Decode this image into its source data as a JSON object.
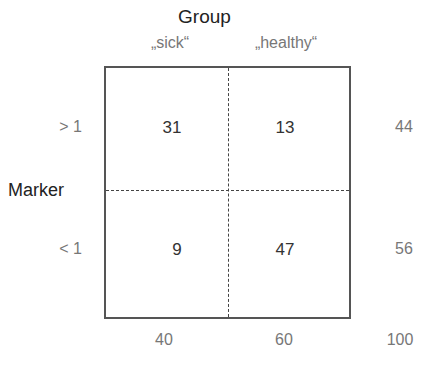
{
  "title": "Group",
  "columns": [
    "„sick“",
    "„healthy“"
  ],
  "row_axis_label": "Marker",
  "rows": [
    "> 1",
    "< 1"
  ],
  "cells": [
    [
      31,
      13
    ],
    [
      9,
      47
    ]
  ],
  "row_totals": [
    44,
    56
  ],
  "col_totals": [
    40,
    60
  ],
  "grand_total": 100,
  "colors": {
    "text_dark": "#222222",
    "text_gray": "#777777",
    "border": "#555555"
  }
}
